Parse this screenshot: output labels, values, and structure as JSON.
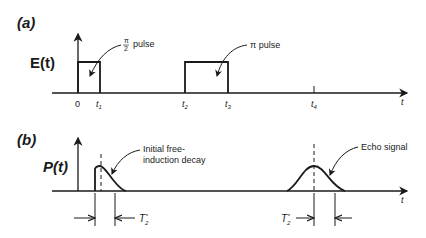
{
  "panel_a": {
    "label": "(a)",
    "ylabel": "E(t)",
    "x_axis_label": "t",
    "ticks": {
      "t0": "0",
      "t1": "t",
      "t1_sub": "1",
      "t2": "t",
      "t2_sub": "2",
      "t3": "t",
      "t3_sub": "3",
      "t4": "t",
      "t4_sub": "4"
    },
    "pulse1_annotation_num": "π",
    "pulse1_annotation_den": "2",
    "pulse1_annotation_text": "pulse",
    "pulse2_annotation": "π pulse"
  },
  "panel_b": {
    "label": "(b)",
    "ylabel": "P(t)",
    "x_axis_label": "t",
    "fid_annotation_line1": "Initial free-",
    "fid_annotation_line2": "induction decay",
    "echo_annotation": "Echo signal",
    "t2star_left": "T",
    "t2star_left_sub": "2",
    "t2star_left_sup": "*",
    "t2star_right": "T",
    "t2star_right_sub": "2",
    "t2star_right_sup": "*"
  },
  "colors": {
    "ink": "#1a1a1a",
    "background": "#ffffff"
  }
}
